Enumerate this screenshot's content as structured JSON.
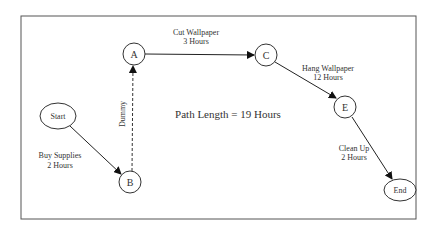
{
  "diagram": {
    "title": "Path Length = 19 Hours",
    "nodes": [
      {
        "id": "start",
        "label": "Start"
      },
      {
        "id": "a",
        "label": "A"
      },
      {
        "id": "b",
        "label": "B"
      },
      {
        "id": "c",
        "label": "C"
      },
      {
        "id": "e",
        "label": "E"
      },
      {
        "id": "end",
        "label": "End"
      }
    ],
    "edges": [
      {
        "from": "Start",
        "to": "B",
        "label1": "Buy Supplies",
        "label2": "2 Hours"
      },
      {
        "from": "B",
        "to": "A",
        "label1": "Dummy",
        "style": "dashed"
      },
      {
        "from": "A",
        "to": "C",
        "label1": "Cut Wallpaper",
        "label2": "3 Hours"
      },
      {
        "from": "C",
        "to": "E",
        "label1": "Hang Wallpaper",
        "label2": "12 Hours"
      },
      {
        "from": "E",
        "to": "End",
        "label1": "Clean Up",
        "label2": "2 Hours"
      }
    ]
  }
}
